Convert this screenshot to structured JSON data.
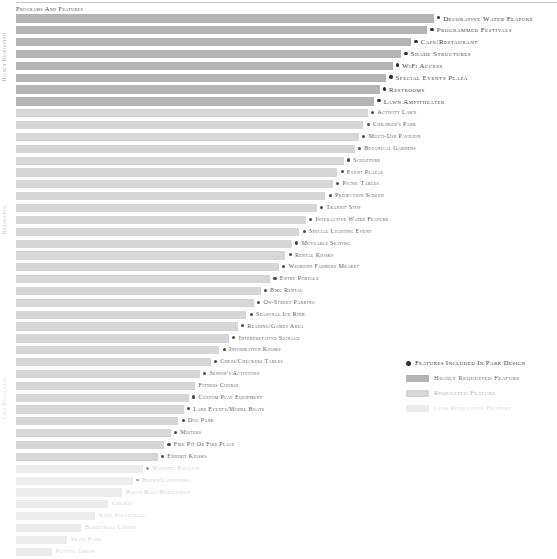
{
  "chart": {
    "title": "Programs and Features",
    "type": "bar"
  },
  "axis": {
    "tier_high_label": "Highly Requested",
    "tier_mid_label": "Requested",
    "tier_low_label": "Less Requested"
  },
  "legend": {
    "included_label": "Features Included in Park Design",
    "high_label": "Highly Requested Feature",
    "mid_label": "Requested Feature",
    "low_label": "Less Requested Feature"
  },
  "colors": {
    "tier_high": "#b4b4b4",
    "tier_mid": "#d6d6d6",
    "tier_low": "#ededed",
    "dot": "#2f2f2f"
  },
  "chart_data": {
    "type": "bar",
    "orientation": "horizontal",
    "title": "Programs and Features",
    "xlabel": "",
    "ylabel": "Request Level",
    "grid": false,
    "legend_position": "bottom-right",
    "xlim": [
      0,
      100
    ],
    "tiers": [
      "Highly Requested",
      "Requested",
      "Less Requested"
    ],
    "categories": [
      "Decorative Water Feature",
      "Programmed Festivals",
      "Cafe/Restaurant",
      "Shade Structures",
      "WiFi Access",
      "Special Events Plaza",
      "Restrooms",
      "Lawn Ampitheater",
      "Activity Lawn",
      "Children's Park",
      "Multi-use Pavilion",
      "Botanical Gardens",
      "Sculpture",
      "Event Plazas",
      "Picnic Tables",
      "Projection Screen",
      "Transit Stop",
      "Interactive Water Feature",
      "Special Lighting Event",
      "Moveable Seating",
      "Rental Kiosks",
      "Weekend Farmers Mraket",
      "Entry Portals",
      "Bike Rental",
      "On-Street Parking",
      "Seasonal Ice Rink",
      "Reading/Games Area",
      "Interpretative Signage",
      "Information Kiosks",
      "Chess/Checkers Tables",
      "Senior's Activities",
      "Fitness Course",
      "Custom Play Equipment",
      "Lake Events/Model Boats",
      "Dog Park",
      "Misters",
      "Fire Pit or Fire Place",
      "Exhibit Kiosks",
      "Wedding Pavilion",
      "Berms/Landforms",
      "Bocce Ball/Horseshoes",
      "Cricket",
      "Sand Volleyball",
      "Basketball Courts",
      "Skate Park",
      "Putting Green"
    ],
    "values": [
      77.2,
      76.0,
      73.0,
      71.2,
      69.6,
      68.4,
      67.2,
      66.2,
      65.0,
      64.2,
      63.4,
      62.6,
      60.6,
      59.4,
      58.6,
      57.2,
      55.6,
      53.6,
      52.4,
      51.0,
      49.8,
      48.6,
      47.0,
      45.2,
      44.0,
      42.6,
      41.0,
      39.4,
      37.6,
      36.0,
      34.0,
      33.0,
      32.0,
      31.0,
      30.0,
      28.6,
      27.4,
      26.2,
      23.4,
      21.6,
      19.6,
      17.0,
      14.6,
      12.0,
      9.4,
      6.6
    ],
    "rows": [
      {
        "label": "Decorative Water Feature",
        "value": 77.2,
        "tier": "high",
        "included": true
      },
      {
        "label": "Programmed Festivals",
        "value": 76.0,
        "tier": "high",
        "included": true
      },
      {
        "label": "Cafe/Restaurant",
        "value": 73.0,
        "tier": "high",
        "included": true
      },
      {
        "label": "Shade Structures",
        "value": 71.2,
        "tier": "high",
        "included": true
      },
      {
        "label": "WiFi Access",
        "value": 69.6,
        "tier": "high",
        "included": true
      },
      {
        "label": "Special Events Plaza",
        "value": 68.4,
        "tier": "high",
        "included": true
      },
      {
        "label": "Restrooms",
        "value": 67.2,
        "tier": "high",
        "included": true
      },
      {
        "label": "Lawn Ampitheater",
        "value": 66.2,
        "tier": "high",
        "included": true
      },
      {
        "label": "Activity Lawn",
        "value": 65.0,
        "tier": "mid",
        "included": true
      },
      {
        "label": "Children's Park",
        "value": 64.2,
        "tier": "mid",
        "included": true
      },
      {
        "label": "Multi-use Pavilion",
        "value": 63.4,
        "tier": "mid",
        "included": true
      },
      {
        "label": "Botanical Gardens",
        "value": 62.6,
        "tier": "mid",
        "included": true
      },
      {
        "label": "Sculpture",
        "value": 60.6,
        "tier": "mid",
        "included": true
      },
      {
        "label": "Event Plazas",
        "value": 59.4,
        "tier": "mid",
        "included": true
      },
      {
        "label": "Picnic Tables",
        "value": 58.6,
        "tier": "mid",
        "included": true
      },
      {
        "label": "Projection Screen",
        "value": 57.2,
        "tier": "mid",
        "included": true
      },
      {
        "label": "Transit Stop",
        "value": 55.6,
        "tier": "mid",
        "included": true
      },
      {
        "label": "Interactive Water Feature",
        "value": 53.6,
        "tier": "mid",
        "included": true
      },
      {
        "label": "Special Lighting Event",
        "value": 52.4,
        "tier": "mid",
        "included": true
      },
      {
        "label": "Moveable Seating",
        "value": 51.0,
        "tier": "mid",
        "included": true
      },
      {
        "label": "Rental Kiosks",
        "value": 49.8,
        "tier": "mid",
        "included": true
      },
      {
        "label": "Weekend Farmers Mraket",
        "value": 48.6,
        "tier": "mid",
        "included": true
      },
      {
        "label": "Entry Portals",
        "value": 47.0,
        "tier": "mid",
        "included": true
      },
      {
        "label": "Bike Rental",
        "value": 45.2,
        "tier": "mid",
        "included": true
      },
      {
        "label": "On-Street Parking",
        "value": 44.0,
        "tier": "mid",
        "included": true
      },
      {
        "label": "Seasonal Ice Rink",
        "value": 42.6,
        "tier": "mid",
        "included": true
      },
      {
        "label": "Reading/Games Area",
        "value": 41.0,
        "tier": "mid",
        "included": true
      },
      {
        "label": "Interpretative Signage",
        "value": 39.4,
        "tier": "mid",
        "included": true
      },
      {
        "label": "Information Kiosks",
        "value": 37.6,
        "tier": "mid",
        "included": true
      },
      {
        "label": "Chess/Checkers Tables",
        "value": 36.0,
        "tier": "mid",
        "included": true
      },
      {
        "label": "Senior's Activities",
        "value": 34.0,
        "tier": "mid",
        "included": true
      },
      {
        "label": "Fitness Course",
        "value": 33.0,
        "tier": "mid",
        "included": false
      },
      {
        "label": "Custom Play Equipment",
        "value": 32.0,
        "tier": "mid",
        "included": true
      },
      {
        "label": "Lake Events/Model Boats",
        "value": 31.0,
        "tier": "mid",
        "included": true
      },
      {
        "label": "Dog Park",
        "value": 30.0,
        "tier": "mid",
        "included": true
      },
      {
        "label": "Misters",
        "value": 28.6,
        "tier": "mid",
        "included": true
      },
      {
        "label": "Fire Pit or Fire Place",
        "value": 27.4,
        "tier": "mid",
        "included": true
      },
      {
        "label": "Exhibit Kiosks",
        "value": 26.2,
        "tier": "mid",
        "included": true
      },
      {
        "label": "Wedding Pavilion",
        "value": 23.4,
        "tier": "low",
        "included": true
      },
      {
        "label": "Berms/Landforms",
        "value": 21.6,
        "tier": "low",
        "included": true
      },
      {
        "label": "Bocce Ball/Horseshoes",
        "value": 19.6,
        "tier": "low",
        "included": false
      },
      {
        "label": "Cricket",
        "value": 17.0,
        "tier": "low",
        "included": false
      },
      {
        "label": "Sand Volleyball",
        "value": 14.6,
        "tier": "low",
        "included": false
      },
      {
        "label": "Basketball Courts",
        "value": 12.0,
        "tier": "low",
        "included": false
      },
      {
        "label": "Skate Park",
        "value": 9.4,
        "tier": "low",
        "included": false
      },
      {
        "label": "Putting Green",
        "value": 6.6,
        "tier": "low",
        "included": false
      }
    ]
  }
}
